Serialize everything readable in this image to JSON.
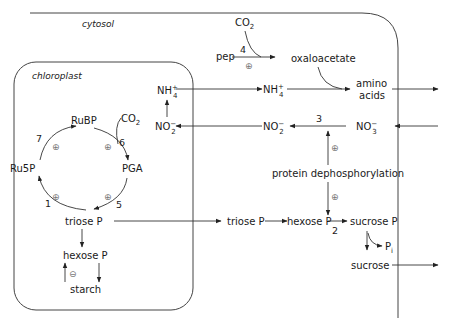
{
  "compartments": {
    "cytosol": "cytosol",
    "chloroplast": "chloroplast"
  },
  "calvin_cycle": {
    "rubp": "RuBP",
    "pga": "PGA",
    "ru5p": "Ru5P",
    "co2": "CO",
    "co2_sub": "2",
    "step_7": "7",
    "step_6": "6",
    "step_5": "5",
    "step_1": "1",
    "activation": "⊕"
  },
  "chloroplast_metabolites": {
    "triose_p": "triose P",
    "hexose_p": "hexose P",
    "starch": "starch",
    "nh4": "NH",
    "nh4_sup": "+",
    "nh4_sub": "4",
    "no2": "NO",
    "no2_sup": "−",
    "no2_sub": "2",
    "inhibition": "⊖"
  },
  "cytosol_metabolites": {
    "co2": "CO",
    "co2_sub": "2",
    "pep": "pep",
    "step_4": "4",
    "oxaloacetate": "oxaloacetate",
    "nh4": "NH",
    "nh4_sup": "+",
    "nh4_sub": "4",
    "amino": "amino",
    "acids": "acids",
    "no2": "NO",
    "no2_sup": "−",
    "no2_sub": "2",
    "step_3": "3",
    "no3": "NO",
    "no3_sup": "−",
    "no3_sub": "3",
    "protein_dephos": "protein dephosphorylation",
    "triose_p": "triose P",
    "hexose_p": "hexose P",
    "step_2": "2",
    "sucrose_p": "sucrose P",
    "pi": "P",
    "pi_sub": "i",
    "sucrose": "sucrose",
    "activation": "⊕"
  }
}
